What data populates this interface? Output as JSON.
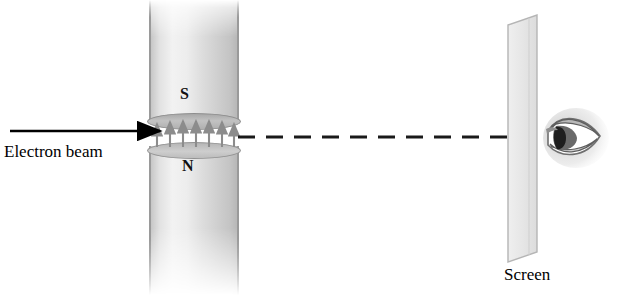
{
  "figure": {
    "width": 622,
    "height": 295,
    "background": "#ffffff"
  },
  "labels": {
    "electron_beam": "Electron beam",
    "screen": "Screen",
    "south_pole": "S",
    "north_pole": "N"
  },
  "magnet": {
    "pole_top": "S",
    "pole_bottom": "N",
    "gap_field_arrow_count": 7,
    "field_direction": "up",
    "column_left_px": 149,
    "column_width_px": 90,
    "gap_top_px": 123,
    "gap_bottom_px": 146,
    "body_color": "#d8d8d8",
    "edge_color": "#9a9a9a",
    "pole_face_color": "#b8b8b8"
  },
  "beam": {
    "incoming_arrow": {
      "x1": 10,
      "y1": 131,
      "x2": 160,
      "y2": 131,
      "color": "#000000",
      "style": "solid-arrow"
    },
    "outgoing_path": {
      "x1": 238,
      "y1": 137,
      "x2": 540,
      "y2": 137,
      "color": "#1a1a1a",
      "style": "dashed"
    }
  },
  "screen": {
    "color": "#e8e8e8",
    "edge_color": "#b0b0b0",
    "corners_px": [
      [
        508,
        25
      ],
      [
        537,
        15
      ],
      [
        537,
        252
      ],
      [
        508,
        262
      ]
    ]
  },
  "eye": {
    "position_px": [
      543,
      108
    ],
    "width_px": 66,
    "height_px": 62,
    "iris_color": "#5a5a5a",
    "pupil_color": "#1a1a1a",
    "view": "side"
  }
}
